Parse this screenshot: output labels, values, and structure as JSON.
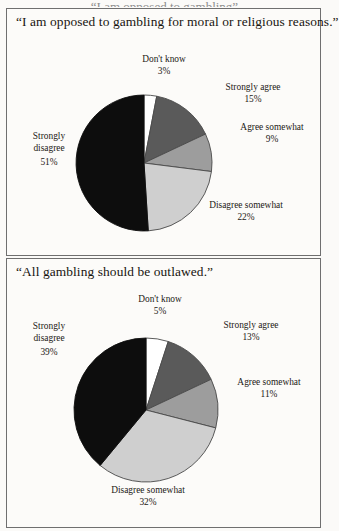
{
  "page": {
    "top_cut_text": "“I am opposed to gambling”",
    "background_color": "#fbfaf8",
    "border_color": "#6f6f6f"
  },
  "palette": {
    "strongly_agree": "#5a5a5a",
    "agree_somewhat": "#9d9d9d",
    "disagree_somewhat": "#cfcfcf",
    "strongly_disagree": "#0d0d0d",
    "dont_know": "#ffffff",
    "outline": "#4a4a4a"
  },
  "panels": [
    {
      "id": "panel-1",
      "title": "“I am opposed to gambling for moral or religious reasons.”",
      "chart_data": {
        "type": "pie",
        "title": "“I am opposed to gambling for moral or religious reasons.”",
        "categories": [
          "Don't know",
          "Strongly agree",
          "Agree somewhat",
          "Disagree somewhat",
          "Strongly disagree"
        ],
        "values": [
          3,
          15,
          9,
          22,
          51
        ],
        "labels": [
          "3%",
          "15%",
          "9%",
          "22%",
          "51%"
        ],
        "units": "percent",
        "total": 100,
        "start_angle_deg": -90,
        "direction": "clockwise",
        "colors": [
          "#ffffff",
          "#5a5a5a",
          "#9d9d9d",
          "#cfcfcf",
          "#0d0d0d"
        ],
        "legend": "none",
        "grid": false,
        "xlabel": "",
        "ylabel": ""
      },
      "slices": [
        {
          "name": "dont-know",
          "label": "Don't know",
          "pct": "3%"
        },
        {
          "name": "strongly-agree",
          "label": "Strongly agree",
          "pct": "15%"
        },
        {
          "name": "agree-somewhat",
          "label": "Agree somewhat",
          "pct": "9%"
        },
        {
          "name": "disagree-somewhat",
          "label": "Disagree somewhat",
          "pct": "22%"
        },
        {
          "name": "strongly-disagree",
          "label_line1": "Strongly",
          "label_line2": "disagree",
          "pct": "51%"
        }
      ]
    },
    {
      "id": "panel-2",
      "title": "“All gambling should be outlawed.”",
      "chart_data": {
        "type": "pie",
        "title": "“All gambling should be outlawed.”",
        "categories": [
          "Don't know",
          "Strongly agree",
          "Agree somewhat",
          "Disagree somewhat",
          "Strongly disagree"
        ],
        "values": [
          5,
          13,
          11,
          32,
          39
        ],
        "labels": [
          "5%",
          "13%",
          "11%",
          "32%",
          "39%"
        ],
        "units": "percent",
        "total": 100,
        "start_angle_deg": -90,
        "direction": "clockwise",
        "colors": [
          "#ffffff",
          "#5a5a5a",
          "#9d9d9d",
          "#cfcfcf",
          "#0d0d0d"
        ],
        "legend": "none",
        "grid": false,
        "xlabel": "",
        "ylabel": ""
      },
      "slices": [
        {
          "name": "dont-know",
          "label": "Don't know",
          "pct": "5%"
        },
        {
          "name": "strongly-agree",
          "label": "Strongly agree",
          "pct": "13%"
        },
        {
          "name": "agree-somewhat",
          "label": "Agree somewhat",
          "pct": "11%"
        },
        {
          "name": "disagree-somewhat",
          "label": "Disagree somewhat",
          "pct": "32%"
        },
        {
          "name": "strongly-disagree",
          "label_line1": "Strongly",
          "label_line2": "disagree",
          "pct": "39%"
        }
      ]
    }
  ]
}
